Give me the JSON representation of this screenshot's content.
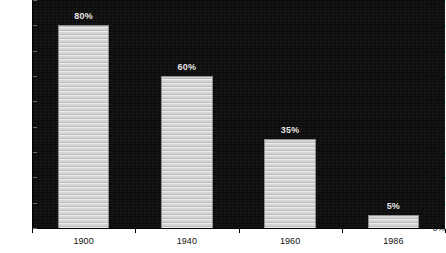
{
  "chart_data": {
    "type": "bar",
    "title": "",
    "subtitle": "",
    "xlabel": "",
    "ylabel": "",
    "categories": [
      "1900",
      "1940",
      "1960",
      "1986"
    ],
    "values": [
      80,
      60,
      35,
      5
    ],
    "value_labels": [
      "80%",
      "60%",
      "35%",
      "5%"
    ],
    "ylim": [
      0,
      90
    ],
    "y_ticks": [
      0,
      10,
      20,
      30,
      40,
      50,
      60,
      70,
      80,
      90
    ],
    "y_tick_labels": [
      "0%",
      "10%",
      "20%",
      "30%",
      "40%",
      "50%",
      "60%",
      "70%",
      "80%",
      "90%"
    ],
    "grid": false,
    "legend": null,
    "annotations": [],
    "colors": {
      "plot_background": "#0d0d0d",
      "bar_fill": "#d4d6d4",
      "bar_outline": "#8d908d",
      "value_label_text": "#e8e8e8",
      "axis_line": "#000000",
      "axis_text": "#111111",
      "page_background": "#ffffff"
    }
  }
}
